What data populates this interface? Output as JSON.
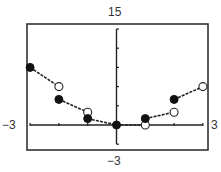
{
  "chart_data": {
    "type": "line",
    "title": "",
    "function_described": "f(x) = x * floor(x)",
    "xlabel": "",
    "ylabel": "",
    "xlim": [
      -3,
      3
    ],
    "ylim": [
      -3,
      15
    ],
    "x_tick_step": 1,
    "y_tick_step": 3,
    "grid": false,
    "window_labels": {
      "xmin": "−3",
      "xmax": "3",
      "ymin": "−3",
      "ymax": "15"
    },
    "segments": [
      {
        "x_start": -3,
        "y_start": 9,
        "start_closed": true,
        "x_end": -2,
        "y_end": 6,
        "end_closed": false
      },
      {
        "x_start": -2,
        "y_start": 4,
        "start_closed": true,
        "x_end": -1,
        "y_end": 2,
        "end_closed": false
      },
      {
        "x_start": -1,
        "y_start": 1,
        "start_closed": true,
        "x_end": 0,
        "y_end": 0,
        "end_closed": false
      },
      {
        "x_start": 0,
        "y_start": 0,
        "start_closed": true,
        "x_end": 1,
        "y_end": 0,
        "end_closed": false
      },
      {
        "x_start": 1,
        "y_start": 1,
        "start_closed": true,
        "x_end": 2,
        "y_end": 2,
        "end_closed": false
      },
      {
        "x_start": 2,
        "y_start": 4,
        "start_closed": true,
        "x_end": 3,
        "y_end": 6,
        "end_closed": false
      }
    ],
    "filled_points": [
      [
        -3,
        9
      ],
      [
        -2,
        4
      ],
      [
        -1,
        1
      ],
      [
        0,
        0
      ],
      [
        1,
        1
      ],
      [
        2,
        4
      ]
    ],
    "open_points": [
      [
        -2,
        6
      ],
      [
        -1,
        2
      ],
      [
        1,
        0
      ],
      [
        2,
        2
      ],
      [
        3,
        6
      ]
    ]
  }
}
